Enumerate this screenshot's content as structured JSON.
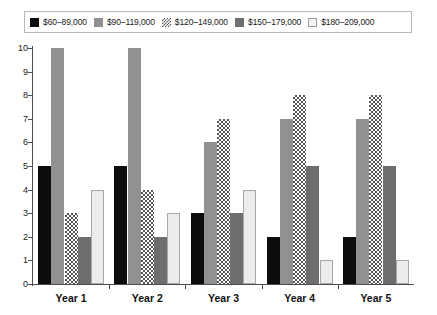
{
  "chart_data": {
    "type": "bar",
    "title": "",
    "xlabel": "",
    "ylabel": "",
    "categories": [
      "Year 1",
      "Year 2",
      "Year 3",
      "Year 4",
      "Year 5"
    ],
    "ylim": [
      0,
      10
    ],
    "yticks": [
      "0",
      "1",
      "2",
      "3",
      "4",
      "5",
      "6",
      "7",
      "8",
      "9",
      "10"
    ],
    "grid": false,
    "legend_position": "top",
    "series": [
      {
        "name": "$60–89,000",
        "values": [
          5,
          5,
          3,
          2,
          2
        ],
        "swatch": "solid-black",
        "color": "#0d0d0d"
      },
      {
        "name": "$90–119,000",
        "values": [
          10,
          10,
          6,
          7,
          7
        ],
        "swatch": "solid-gray",
        "color": "#919191"
      },
      {
        "name": "$120–149,000",
        "values": [
          3,
          4,
          7,
          8,
          8
        ],
        "swatch": "checkered",
        "color": "#555555"
      },
      {
        "name": "$150–179,000",
        "values": [
          2,
          2,
          3,
          5,
          5
        ],
        "swatch": "solid-dark-gray",
        "color": "#6e6e6e"
      },
      {
        "name": "$180–209,000",
        "values": [
          4,
          3,
          4,
          1,
          1
        ],
        "swatch": "outlined-light",
        "color": "#ececec"
      }
    ]
  }
}
